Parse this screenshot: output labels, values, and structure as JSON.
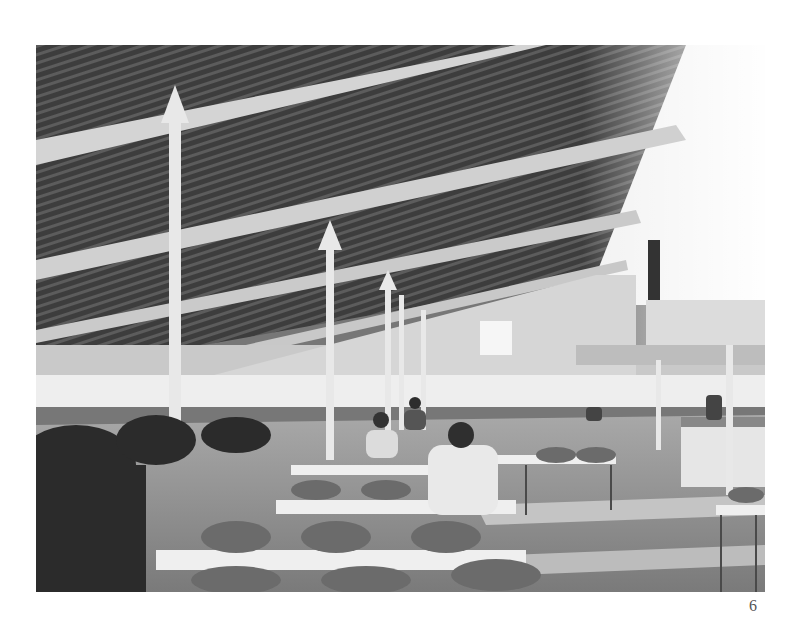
{
  "page": {
    "page_number": "6"
  },
  "photo": {
    "description": "Black and white photograph of a large cafeteria / dining hall interior with slatted wooden sloped ceiling, white columns with arrow-shaped capitals, rows of tables and chairs, potted plants on the left, seated diners, and a serving counter on the right.",
    "colors": {
      "ceiling_dark": "#3a3a3a",
      "ceiling_slat": "#5a5a5a",
      "beam": "#d8d8d8",
      "column": "#e6e6e6",
      "window_light": "#f4f4f4",
      "wall": "#c8c8c8",
      "floor": "#8a8a8a",
      "floor_light": "#b5b5b5",
      "chair": "#6a6a6a",
      "plants": "#2a2a2a"
    }
  }
}
